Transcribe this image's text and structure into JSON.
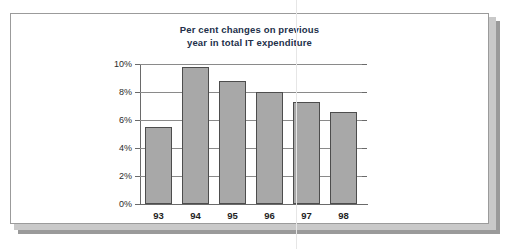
{
  "page": {
    "kind": "scanned-book-page",
    "background_color": "#ffffff",
    "sheet_border_color": "#9b9b9b",
    "shadow_color": "#9a9a9a",
    "gutter_line_color": "#e6e6e6"
  },
  "chart_data": {
    "type": "bar",
    "title": "Per cent changes on previous year in total IT expenditure",
    "title_lines": [
      "Per cent changes on previous",
      "year in total IT expenditure"
    ],
    "xlabel": "",
    "ylabel": "",
    "categories": [
      "93",
      "94",
      "95",
      "96",
      "97",
      "98"
    ],
    "values": [
      5.5,
      9.8,
      8.8,
      8.0,
      7.3,
      6.6
    ],
    "ylim": [
      0,
      10
    ],
    "ytick_values": [
      0,
      2,
      4,
      6,
      8,
      10
    ],
    "ytick_labels": [
      "0%",
      "2%",
      "4%",
      "6%",
      "8%",
      "10%"
    ],
    "grid": true,
    "legend": false,
    "bar_color": "#a8a8a8",
    "bar_border_color": "#4d4d4d",
    "gridline_color": "#8a8a8a",
    "axis_color": "#6a6a6a",
    "title_color": "#23304a"
  }
}
